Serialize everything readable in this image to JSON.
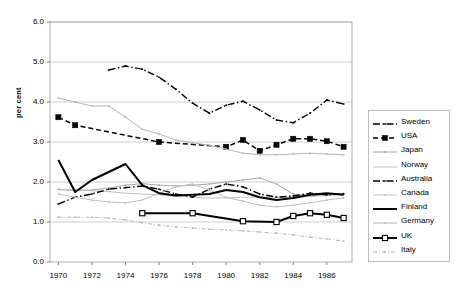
{
  "chart_data": {
    "type": "line",
    "title": "",
    "xlabel": "",
    "ylabel": "per cent",
    "xlim": [
      1969.5,
      1987.5
    ],
    "ylim": [
      0.0,
      6.0
    ],
    "grid": true,
    "legend_position": "right",
    "x": [
      1970,
      1971,
      1972,
      1973,
      1974,
      1975,
      1976,
      1977,
      1978,
      1979,
      1980,
      1981,
      1982,
      1983,
      1984,
      1985,
      1986,
      1987
    ],
    "xticks": [
      1970,
      1972,
      1974,
      1976,
      1978,
      1980,
      1982,
      1984,
      1986
    ],
    "xtick_labels": [
      "1970",
      "1972",
      "1974",
      "1976",
      "1978",
      "1980",
      "1982",
      "1984",
      "1986"
    ],
    "yticks": [
      0.0,
      1.0,
      2.0,
      3.0,
      4.0,
      5.0,
      6.0
    ],
    "ytick_labels": [
      "0.0",
      "1.0",
      "2.0",
      "3.0",
      "4.0",
      "5.0",
      "6.0"
    ],
    "series": [
      {
        "name": "Sweden",
        "color": "#000000",
        "style": "dash-dot",
        "marker": "small-dot",
        "x": [
          1973,
          1974,
          1975,
          1976,
          1977,
          1978,
          1979,
          1980,
          1981,
          1982,
          1983,
          1984,
          1985,
          1986,
          1987
        ],
        "values": [
          4.8,
          4.9,
          4.82,
          4.62,
          4.32,
          3.97,
          3.72,
          3.92,
          4.02,
          3.8,
          3.55,
          3.48,
          3.72,
          4.05,
          3.95
        ]
      },
      {
        "name": "USA",
        "color": "#000000",
        "style": "dashed",
        "marker": "filled-square",
        "x": [
          1970,
          1971,
          1976,
          1980,
          1981,
          1982,
          1983,
          1984,
          1985,
          1986,
          1987
        ],
        "values": [
          3.62,
          3.42,
          3.0,
          2.88,
          3.05,
          2.78,
          2.93,
          3.08,
          3.08,
          3.02,
          2.88
        ]
      },
      {
        "name": "Japan",
        "color": "#a8a8a8",
        "style": "solid-light",
        "marker": "small-dot",
        "x": [
          1970,
          1971,
          1972,
          1973,
          1974,
          1975,
          1976,
          1977,
          1978,
          1979,
          1980,
          1981,
          1982,
          1983,
          1984,
          1985,
          1986,
          1987
        ],
        "values": [
          1.82,
          1.78,
          1.8,
          1.85,
          1.92,
          1.96,
          1.92,
          1.9,
          1.92,
          1.95,
          2.0,
          2.05,
          2.1,
          1.95,
          1.7,
          1.65,
          1.68,
          1.72
        ]
      },
      {
        "name": "Norway",
        "color": "#c0c0c0",
        "style": "solid-light",
        "marker": "none",
        "x": [
          1970,
          1971,
          1972,
          1973,
          1974,
          1975,
          1976,
          1977,
          1978,
          1979,
          1980,
          1981,
          1982,
          1983,
          1984,
          1985,
          1986,
          1987
        ],
        "values": [
          1.8,
          1.82,
          1.78,
          1.76,
          1.72,
          1.7,
          1.68,
          1.64,
          1.62,
          1.6,
          1.6,
          1.62,
          1.62,
          1.62,
          1.62,
          1.64,
          1.66,
          1.7
        ]
      },
      {
        "name": "Australia",
        "color": "#000000",
        "style": "dash-dot",
        "marker": "small-dot",
        "x": [
          1970,
          1971,
          1972,
          1973,
          1974,
          1975,
          1976,
          1977,
          1978,
          1979,
          1980,
          1981,
          1982,
          1983,
          1984,
          1985,
          1986,
          1987
        ],
        "values": [
          1.45,
          1.62,
          1.7,
          1.82,
          1.86,
          1.9,
          1.82,
          1.7,
          1.62,
          1.82,
          1.95,
          1.88,
          1.7,
          1.62,
          1.65,
          1.72,
          1.68,
          1.7
        ]
      },
      {
        "name": "Canada",
        "color": "#bfbfbf",
        "style": "solid-light",
        "marker": "small-dot",
        "x": [
          1970,
          1971,
          1972,
          1973,
          1974,
          1975,
          1976,
          1977,
          1978,
          1979,
          1980,
          1981,
          1982,
          1983,
          1984,
          1985,
          1986,
          1987
        ],
        "values": [
          1.7,
          1.62,
          1.55,
          1.5,
          1.48,
          1.55,
          1.72,
          1.88,
          1.95,
          1.8,
          1.62,
          1.52,
          1.42,
          1.38,
          1.42,
          1.48,
          1.55,
          1.6
        ]
      },
      {
        "name": "Finland",
        "color": "#000000",
        "style": "solid-bold",
        "marker": "none",
        "x": [
          1970,
          1971,
          1972,
          1973,
          1974,
          1975,
          1976,
          1977,
          1978,
          1979,
          1980,
          1981,
          1982,
          1983,
          1984,
          1985,
          1986,
          1987
        ],
        "values": [
          2.55,
          1.75,
          2.05,
          2.25,
          2.45,
          1.92,
          1.72,
          1.66,
          1.68,
          1.7,
          1.8,
          1.75,
          1.62,
          1.55,
          1.6,
          1.68,
          1.72,
          1.68
        ]
      },
      {
        "name": "Germany",
        "color": "#b5b5b5",
        "style": "solid-light",
        "marker": "small-dot",
        "x": [
          1970,
          1971,
          1972,
          1973,
          1974,
          1975,
          1976,
          1977,
          1978,
          1979,
          1980,
          1981,
          1982,
          1983,
          1984,
          1985,
          1986,
          1987
        ],
        "values": [
          4.1,
          4.0,
          3.9,
          3.9,
          3.62,
          3.32,
          3.2,
          3.05,
          2.98,
          2.92,
          2.82,
          2.72,
          2.68,
          2.68,
          2.7,
          2.72,
          2.7,
          2.68
        ]
      },
      {
        "name": "UK",
        "color": "#000000",
        "style": "solid-bold",
        "marker": "open-square",
        "x": [
          1975,
          1978,
          1981,
          1983,
          1984,
          1985,
          1986,
          1987
        ],
        "values": [
          1.22,
          1.22,
          1.02,
          1.0,
          1.15,
          1.22,
          1.18,
          1.1
        ]
      },
      {
        "name": "Italy",
        "color": "#b5b5b5",
        "style": "dash-dot-light",
        "marker": "small-dot",
        "x": [
          1970,
          1971,
          1972,
          1973,
          1974,
          1975,
          1976,
          1977,
          1978,
          1979,
          1980,
          1981,
          1982,
          1983,
          1984,
          1985,
          1986,
          1987
        ],
        "values": [
          1.12,
          1.12,
          1.12,
          1.1,
          1.05,
          0.98,
          0.92,
          0.88,
          0.85,
          0.82,
          0.8,
          0.78,
          0.75,
          0.72,
          0.68,
          0.62,
          0.58,
          0.52
        ]
      }
    ]
  }
}
